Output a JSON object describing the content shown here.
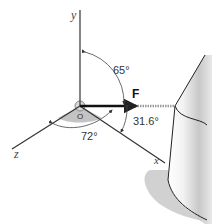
{
  "diagram": {
    "type": "3d-force-vector",
    "axes": {
      "x": {
        "label": "x"
      },
      "y": {
        "label": "y"
      },
      "z": {
        "label": "z"
      }
    },
    "origin_label": "O",
    "force": {
      "label": "F"
    },
    "angles": {
      "from_y": "65°",
      "from_x": "31.6°",
      "from_z": "72°"
    },
    "colors": {
      "axis": "#333333",
      "force": "#111111",
      "cable": "#999999",
      "tank_fill": "#d6d6d6",
      "shadow": "#bdbdbd"
    }
  }
}
